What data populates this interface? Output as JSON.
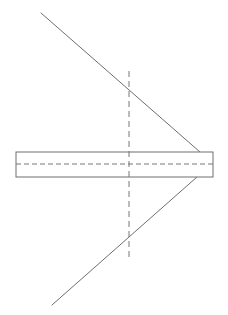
{
  "diagram": {
    "stroke_color": "#6e6e6e",
    "dashed_color": "#777777",
    "background": "#ffffff",
    "strip": {
      "x": 16,
      "y": 152,
      "width": 197,
      "height": 25
    },
    "strip_centerline": {
      "x1": 16,
      "y1": 164,
      "x2": 213,
      "y2": 164
    },
    "vertical_axis": {
      "x1": 129,
      "y1": 71,
      "x2": 129,
      "y2": 261
    },
    "upper_diagonal": {
      "x1": 41,
      "y1": 13,
      "x2": 200,
      "y2": 152
    },
    "lower_diagonal": {
      "x1": 52,
      "y1": 305,
      "x2": 197,
      "y2": 177
    }
  }
}
